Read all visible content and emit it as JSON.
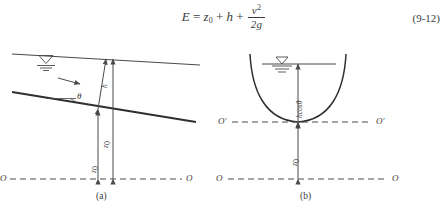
{
  "equation": {
    "lhs": "E",
    "equals": "=",
    "term_z": "z",
    "term_z_sub": "0",
    "plus1": "+",
    "term_h": "h",
    "plus2": "+",
    "frac_num": "v",
    "frac_num_sup": "2",
    "frac_den": "2g",
    "number": "(9-12)"
  },
  "figure": {
    "caption_a": "(a)",
    "caption_b": "(b)",
    "panel_a": {
      "theta_label": "θ",
      "depth_label": "h",
      "elevation_label": "z",
      "elevation_sub": "0",
      "total_label": "z",
      "total_sub": "0",
      "datum_left": "O",
      "datum_right": "O",
      "water_surface_symbol": "▽",
      "flow_arrow": "flow-direction-arrow"
    },
    "panel_b": {
      "depth_label": "hcosθ",
      "elevation_label": "z",
      "elevation_sub": "0",
      "datum_ref_left": "O′",
      "datum_ref_right": "O′",
      "datum_left": "O",
      "datum_right": "O",
      "water_surface_symbol": "▽"
    }
  },
  "colors": {
    "ink": "#3a3a3a",
    "line": "#4a4a4a",
    "background": "#ffffff"
  }
}
